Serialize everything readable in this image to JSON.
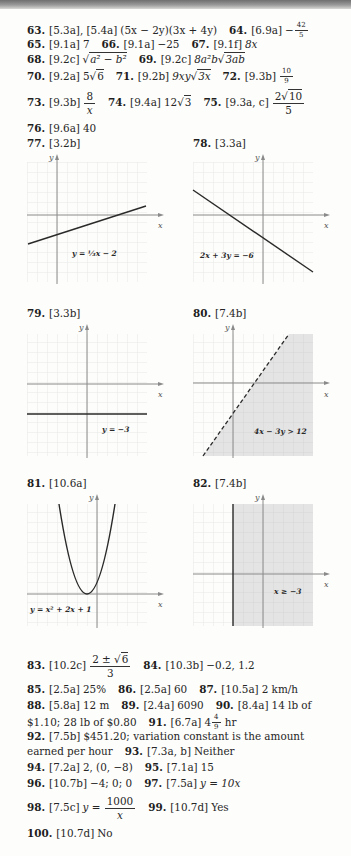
{
  "page": {
    "answers_text": [
      {
        "num": "63.",
        "ref": "[5.3a], [5.4a]",
        "answer": "(5x − 2y)(3x + 4y)"
      },
      {
        "num": "64.",
        "ref": "[6.9a]",
        "answer_sign": "−",
        "answer_num": "42",
        "answer_den": "5"
      },
      {
        "num": "65.",
        "ref": "[9.1a]",
        "answer": "7"
      },
      {
        "num": "66.",
        "ref": "[9.1a]",
        "answer": "−25"
      },
      {
        "num": "67.",
        "ref": "[9.1f]",
        "answer": "8x"
      },
      {
        "num": "68.",
        "ref": "[9.2c]",
        "answer_radicand": "a² − b²"
      },
      {
        "num": "69.",
        "ref": "[9.2c]",
        "answer_coef": "8a²b",
        "answer_radicand": "3ab"
      },
      {
        "num": "70.",
        "ref": "[9.2a]",
        "answer_coef": "5",
        "answer_radicand": "6"
      },
      {
        "num": "71.",
        "ref": "[9.2b]",
        "answer_coef": "9xy",
        "answer_radicand": "3x"
      },
      {
        "num": "72.",
        "ref": "[9.3b]",
        "answer_num": "10",
        "answer_den": "9"
      },
      {
        "num": "73.",
        "ref": "[9.3b]",
        "answer_num": "8",
        "answer_den": "x"
      },
      {
        "num": "74.",
        "ref": "[9.4a]",
        "answer_coef": "12",
        "answer_radicand": "3"
      },
      {
        "num": "75.",
        "ref": "[9.3a, c]",
        "answer_num_coef": "2",
        "answer_num_radicand": "10",
        "answer_den": "5"
      },
      {
        "num": "76.",
        "ref": "[9.6a]",
        "answer": "40"
      },
      {
        "num": "83.",
        "ref": "[10.2c]",
        "answer_num": "2 ± ",
        "answer_num_radicand": "6",
        "answer_den": "3"
      },
      {
        "num": "84.",
        "ref": "[10.3b]",
        "answer": "−0.2, 1.2"
      },
      {
        "num": "85.",
        "ref": "[2.5a]",
        "answer": "25%"
      },
      {
        "num": "86.",
        "ref": "[2.5a]",
        "answer": "60"
      },
      {
        "num": "87.",
        "ref": "[10.5a]",
        "answer": "2 km/h"
      },
      {
        "num": "88.",
        "ref": "[5.8a]",
        "answer": "12 m"
      },
      {
        "num": "89.",
        "ref": "[2.4a]",
        "answer": "6090"
      },
      {
        "num": "90.",
        "ref": "[8.4a]",
        "answer": "14 lb of",
        "answer_cont": "$1.10; 28 lb of $0.80"
      },
      {
        "num": "91.",
        "ref": "[6.7a]",
        "answer_whole": "4",
        "answer_num": "4",
        "answer_den": "9",
        "answer_unit": "hr"
      },
      {
        "num": "92.",
        "ref": "[7.5b]",
        "answer": "$451.20; variation constant is the amount",
        "answer_cont": "earned per hour"
      },
      {
        "num": "93.",
        "ref": "[7.3a, b]",
        "answer": "Neither"
      },
      {
        "num": "94.",
        "ref": "[7.2a]",
        "answer": "2, (0, −8)"
      },
      {
        "num": "95.",
        "ref": "[7.1a]",
        "answer": "15"
      },
      {
        "num": "96.",
        "ref": "[10.7b]",
        "answer": "−4; 0; 0"
      },
      {
        "num": "97.",
        "ref": "[7.5a]",
        "answer": "y = 10x"
      },
      {
        "num": "98.",
        "ref": "[7.5c]",
        "answer_lhs": "y =",
        "answer_num": "1000",
        "answer_den": "x"
      },
      {
        "num": "99.",
        "ref": "[10.7d]",
        "answer": "Yes"
      },
      {
        "num": "100.",
        "ref": "[10.7d]",
        "answer": "No"
      }
    ],
    "graphs": [
      {
        "num": "77.",
        "ref": "[3.2b]",
        "equation": "y = ⅓x − 2",
        "x_axis": "x",
        "y_axis": "y",
        "type": "line"
      },
      {
        "num": "78.",
        "ref": "[3.3a]",
        "equation": "2x + 3y = −6",
        "x_axis": "x",
        "y_axis": "y",
        "type": "line"
      },
      {
        "num": "79.",
        "ref": "[3.3b]",
        "equation": "y = −3",
        "x_axis": "x",
        "y_axis": "y",
        "type": "line"
      },
      {
        "num": "80.",
        "ref": "[7.4b]",
        "equation": "4x − 3y > 12",
        "x_axis": "x",
        "y_axis": "y",
        "type": "inequality"
      },
      {
        "num": "81.",
        "ref": "[10.6a]",
        "equation": "y = x² + 2x + 1",
        "x_axis": "x",
        "y_axis": "y",
        "type": "parabola"
      },
      {
        "num": "82.",
        "ref": "[7.4b]",
        "equation": "x ≥ −3",
        "x_axis": "x",
        "y_axis": "y",
        "type": "inequality"
      }
    ],
    "colors": {
      "text": "#262626",
      "grid": "#e6e6e6",
      "axis": "#8a8a8a",
      "curve": "#2a2a2a",
      "shade": "#e4e4e4"
    }
  }
}
